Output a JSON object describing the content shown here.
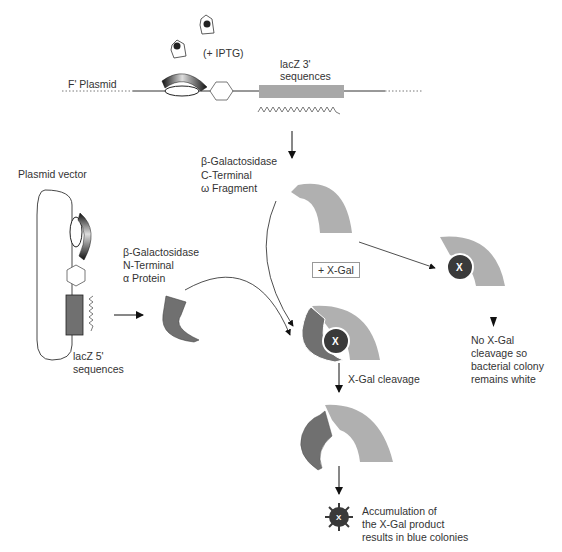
{
  "diagram": {
    "type": "lac-operon blue-white screening (alpha complementation)",
    "colors": {
      "c_fragment": "#b0b0b0",
      "n_protein": "#707070",
      "xgal_substrate": "#3a3a3a",
      "dna_line": "#333333",
      "lacz_block": "#a8a8a8"
    }
  },
  "labels": {
    "iptg": "(+ IPTG)",
    "f_plasmid": "F' Plasmid",
    "lacz3_line1": "lacZ 3'",
    "lacz3_line2": "sequences",
    "plasmid_vector": "Plasmid vector",
    "c_term_line1": "β-Galactosidase",
    "c_term_line2": "C-Terminal",
    "c_term_line3": "ω Fragment",
    "n_term_line1": "β-Galactosidase",
    "n_term_line2": "N-Terminal",
    "n_term_line3": "α Protein",
    "lacz5_line1": "lacZ 5'",
    "lacz5_line2": "sequences",
    "xgal_box": "+ X-Gal",
    "xgal_cleavage": "X-Gal cleavage",
    "substrate_mark": "X",
    "white_line1": "No X-Gal",
    "white_line2": "cleavage so",
    "white_line3": "bacterial colony",
    "white_line4": "remains white",
    "blue_line1": "Accumulation of",
    "blue_line2": "the X-Gal product",
    "blue_line3": "results in blue colonies"
  }
}
